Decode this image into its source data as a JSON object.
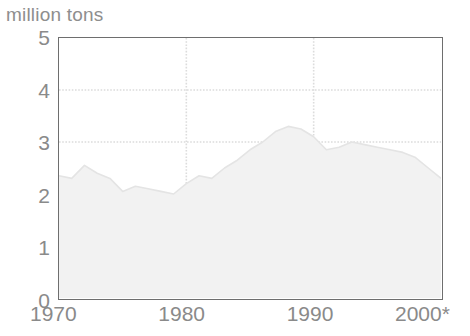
{
  "chart_data": {
    "type": "area",
    "title": "",
    "ylabel": "million tons",
    "xlabel": "",
    "ylim": [
      0,
      5
    ],
    "xlim": [
      1970,
      2000
    ],
    "grid": true,
    "legend": "none",
    "y_ticks": [
      "0",
      "1",
      "2",
      "3",
      "4",
      "5"
    ],
    "y_tick_values": [
      0,
      1,
      2,
      3,
      4,
      5
    ],
    "x_ticks": [
      "1970",
      "1980",
      "1990",
      "2000*"
    ],
    "x_tick_values": [
      1970,
      1980,
      1990,
      2000
    ],
    "footnote_marker": "*",
    "series": [
      {
        "name": "million tons",
        "x": [
          1970,
          1971,
          1972,
          1973,
          1974,
          1975,
          1976,
          1977,
          1978,
          1979,
          1980,
          1981,
          1982,
          1983,
          1984,
          1985,
          1986,
          1987,
          1988,
          1989,
          1990,
          1991,
          1992,
          1993,
          1994,
          1995,
          1996,
          1997,
          1998,
          1999,
          2000
        ],
        "values": [
          2.35,
          2.3,
          2.55,
          2.4,
          2.3,
          2.05,
          2.15,
          2.1,
          2.05,
          2.0,
          2.2,
          2.35,
          2.3,
          2.5,
          2.65,
          2.85,
          3.0,
          3.2,
          3.3,
          3.25,
          3.1,
          2.85,
          2.9,
          3.0,
          2.95,
          2.9,
          2.85,
          2.8,
          2.7,
          2.5,
          2.3
        ]
      }
    ],
    "colors": {
      "area_fill": "#f2f2f2",
      "area_line": "#e4e4e4",
      "axis": "#6e6e6e",
      "gridline": "#dcdcdc",
      "tick_text": "#8a8a8a",
      "title_text": "#8e8e8e",
      "background": "#ffffff"
    }
  }
}
